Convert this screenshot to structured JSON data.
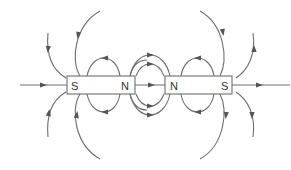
{
  "diagram": {
    "colors": {
      "line": "#6e6e6e",
      "arrow": "#555555",
      "text": "#333333",
      "background": "#ffffff"
    },
    "magnets": [
      {
        "id": "left",
        "left_pole": "S",
        "right_pole": "N"
      },
      {
        "id": "right",
        "left_pole": "N",
        "right_pole": "S"
      }
    ],
    "labels": {
      "left_magnet_left": "S",
      "left_magnet_right": "N",
      "right_magnet_left": "N",
      "right_magnet_right": "S"
    }
  }
}
